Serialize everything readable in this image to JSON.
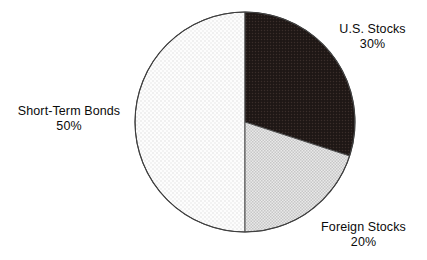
{
  "canvas": {
    "width": 427,
    "height": 260,
    "background": "#ffffff"
  },
  "chart_data": {
    "type": "pie",
    "title": "",
    "subtitle": "",
    "xlabel": "",
    "ylabel": "",
    "legend_position": "none",
    "grid": false,
    "label_format": "name-over-percent",
    "start_angle_deg": 0,
    "direction": "clockwise",
    "total_percent": 100,
    "categories": [
      "U.S. Stocks",
      "Foreign Stocks",
      "Short-Term Bonds"
    ],
    "values": [
      30,
      20,
      50
    ],
    "slices": [
      {
        "name": "U.S. Stocks",
        "value": 30,
        "percent_text": "30%",
        "fill_color": "#221a18",
        "fill_style": "dark-dotted",
        "start_angle_deg": 0,
        "end_angle_deg": 108,
        "label_position": "right-top"
      },
      {
        "name": "Foreign Stocks",
        "value": 20,
        "percent_text": "20%",
        "fill_color": "#d8d8d8",
        "fill_style": "gray-checkered",
        "start_angle_deg": 108,
        "end_angle_deg": 180,
        "label_position": "bottom-right"
      },
      {
        "name": "Short-Term Bonds",
        "value": 50,
        "percent_text": "50%",
        "fill_color": "#fafafa",
        "fill_style": "light-sparse-dots",
        "start_angle_deg": 180,
        "end_angle_deg": 360,
        "label_position": "left"
      }
    ],
    "outline_color": "#4a4a4a",
    "geometry": {
      "center_x": 245,
      "center_y": 122,
      "radius": 110
    }
  },
  "labels": {
    "us_stocks": {
      "name": "U.S. Stocks",
      "value": "30%"
    },
    "foreign_stocks": {
      "name": "Foreign Stocks",
      "value": "20%"
    },
    "short_term_bonds": {
      "name": "Short-Term Bonds",
      "value": "50%"
    }
  }
}
